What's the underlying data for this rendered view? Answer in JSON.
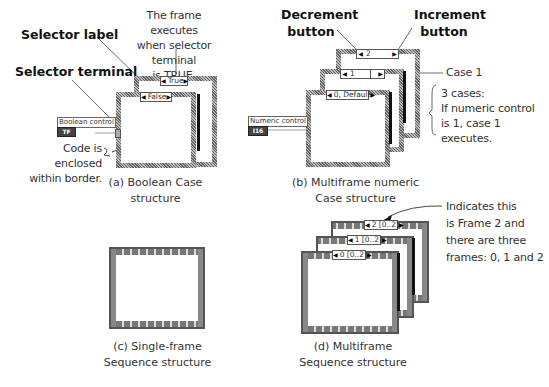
{
  "panel_a": {
    "callouts": {
      "selector_label": "Selector label",
      "selector_terminal": "Selector terminal",
      "frame_executes": [
        "The frame executes",
        "when selector terminal",
        "is TRUE."
      ],
      "code_enclosed": [
        "Code is enclosed",
        "within border."
      ]
    },
    "frames": {
      "back_selector": "True",
      "front_selector": "False"
    },
    "control": {
      "label": "Boolean control",
      "terminal": "TF"
    },
    "caption": "(a) Boolean Case structure"
  },
  "panel_b": {
    "callouts": {
      "decrement": [
        "Decrement",
        "button"
      ],
      "increment": [
        "Increment",
        "button"
      ],
      "case1": "Case 1",
      "cases_note": [
        "3 cases:",
        "If numeric control",
        "is 1, case 1 executes."
      ]
    },
    "frames": {
      "back_selector": "2",
      "middle_selector": "1",
      "front_selector": "0, Default"
    },
    "control": {
      "label": "Numeric control",
      "terminal": "I16"
    },
    "caption": [
      "(b) Multiframe numeric",
      "Case structure"
    ]
  },
  "panel_c": {
    "caption": [
      "(c) Single-frame",
      "Sequence structure"
    ]
  },
  "panel_d": {
    "frames": {
      "back_selector": "2 [0..2]",
      "middle_selector": "1 [0..2]",
      "front_selector": "0 [0..2]"
    },
    "callout": [
      "Indicates this",
      "is Frame 2 and",
      "there are three",
      "frames: 0, 1 and 2"
    ],
    "caption": [
      "(d) Multiframe",
      "Sequence structure"
    ]
  },
  "icons": {
    "decrement": "◀",
    "increment": "▶"
  }
}
